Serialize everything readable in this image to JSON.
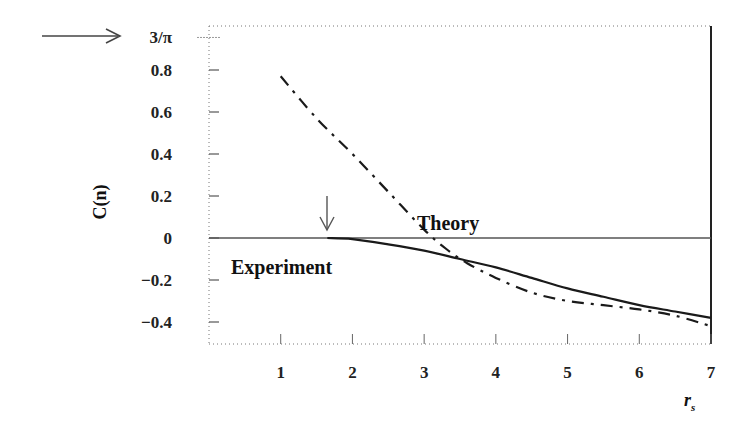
{
  "chart_data": {
    "type": "line",
    "title": "",
    "xlabel": "r_s",
    "ylabel": "C(n)",
    "xlim": [
      0,
      7
    ],
    "ylim": [
      -0.5,
      1.0
    ],
    "x_ticks": [
      "1",
      "2",
      "3",
      "4",
      "5",
      "6",
      "7"
    ],
    "y_ticks": [
      "3/π",
      "0.8",
      "0.6",
      "0.4",
      "0.2",
      "0",
      "−0.2",
      "−0.4"
    ],
    "grid": false,
    "legend": "none (inline annotations)",
    "reference_lines": [
      {
        "y": 0,
        "style": "solid thin"
      }
    ],
    "annotations": [
      {
        "text": "3/π",
        "note": "arrow pointing to y = 3/π ≈ 0.955"
      },
      {
        "text": "Theory",
        "x": 3.8,
        "y": 0.05
      },
      {
        "text": "Experiment",
        "x": 1.1,
        "y": -0.12
      },
      {
        "text": "↓",
        "x": 1.65,
        "y": 0.05,
        "note": "arrow marking onset r_s ≈ 1.65"
      }
    ],
    "series": [
      {
        "name": "Theory",
        "style": "dash-dot",
        "x": [
          1.0,
          1.5,
          2.0,
          2.5,
          3.0,
          3.3,
          3.6,
          4.0,
          4.5,
          5.0,
          5.5,
          6.0,
          6.5,
          7.0
        ],
        "y": [
          0.77,
          0.57,
          0.4,
          0.22,
          0.04,
          -0.05,
          -0.12,
          -0.19,
          -0.26,
          -0.3,
          -0.32,
          -0.34,
          -0.37,
          -0.42
        ]
      },
      {
        "name": "Experiment",
        "style": "solid",
        "x": [
          1.65,
          2.0,
          2.5,
          3.0,
          3.5,
          4.0,
          4.5,
          5.0,
          5.5,
          6.0,
          6.5,
          7.0
        ],
        "y": [
          0.0,
          -0.005,
          -0.03,
          -0.06,
          -0.1,
          -0.14,
          -0.19,
          -0.24,
          -0.28,
          -0.32,
          -0.35,
          -0.38
        ]
      }
    ]
  },
  "labels": {
    "y_axis": "C(n)",
    "x_axis": "r",
    "x_axis_sub": "s",
    "theory": "Theory",
    "experiment": "Experiment",
    "three_over_pi": "3/π"
  }
}
